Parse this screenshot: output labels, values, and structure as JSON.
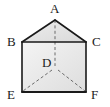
{
  "figure": {
    "kind": "geometry-diagram",
    "canvas": {
      "width": 110,
      "height": 107
    },
    "colors": {
      "stroke": "#1a1a1a",
      "dashed_stroke": "#6b6b6b",
      "face_light": "#f2f2f2",
      "face_mid": "#e2e2e2",
      "face_dark": "#d6d6d6",
      "label": "#1a1a1a",
      "background": "#ffffff"
    },
    "vertices": [
      {
        "id": "A",
        "label": "A",
        "x": 55,
        "y": 20,
        "label_x": 50,
        "label_y": 2
      },
      {
        "id": "B",
        "label": "B",
        "x": 22,
        "y": 42,
        "label_x": 7,
        "label_y": 35
      },
      {
        "id": "C",
        "label": "C",
        "x": 86,
        "y": 42,
        "label_x": 92,
        "label_y": 35
      },
      {
        "id": "D",
        "label": "D",
        "x": 55,
        "y": 68,
        "label_x": 42,
        "label_y": 56
      },
      {
        "id": "E",
        "label": "E",
        "x": 22,
        "y": 92,
        "label_x": 7,
        "label_y": 88
      },
      {
        "id": "F",
        "label": "F",
        "x": 86,
        "y": 92,
        "label_x": 91,
        "label_y": 88
      }
    ],
    "solid_edges": [
      {
        "from": "B",
        "to": "A"
      },
      {
        "from": "A",
        "to": "C"
      },
      {
        "from": "B",
        "to": "C"
      },
      {
        "from": "B",
        "to": "E"
      },
      {
        "from": "C",
        "to": "F"
      },
      {
        "from": "E",
        "to": "F"
      }
    ],
    "dashed_edges": [
      {
        "from": "A",
        "to": "D"
      },
      {
        "from": "D",
        "to": "E"
      },
      {
        "from": "D",
        "to": "F"
      }
    ],
    "faces": [
      {
        "id": "roof",
        "points": "22,42 55,20 86,42",
        "shade": "face_mid"
      },
      {
        "id": "front",
        "points": "22,42 86,42 86,92 22,92",
        "shade": "face_light"
      }
    ]
  }
}
